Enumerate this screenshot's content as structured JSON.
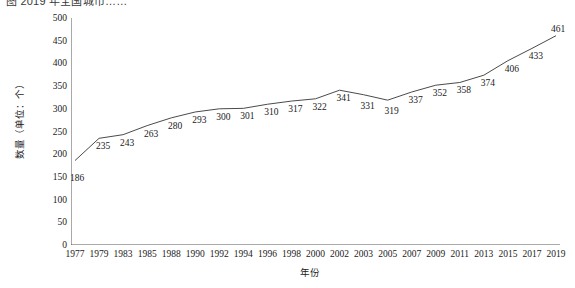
{
  "chart_title": "图 2019 年全国城市……",
  "axis": {
    "y_title": "数量（单位：个）",
    "x_title": "年份",
    "y_ticks": [
      "0",
      "50",
      "100",
      "150",
      "200",
      "250",
      "300",
      "350",
      "400",
      "450",
      "500"
    ],
    "x_ticks": [
      "1977",
      "1979",
      "1983",
      "1985",
      "1988",
      "1990",
      "1992",
      "1994",
      "1996",
      "1998",
      "2000",
      "2002",
      "2003",
      "2005",
      "2007",
      "2009",
      "2011",
      "2013",
      "2015",
      "2017",
      "2019"
    ]
  },
  "style": {
    "line_color": "#4a4a4a",
    "axis_color": "#555555",
    "text_color": "#1a1a1a",
    "background": "#ffffff"
  },
  "chart_data": {
    "type": "line",
    "title": "图 2019 年全国城市……",
    "xlabel": "年份",
    "ylabel": "数量（单位：个）",
    "ylim": [
      0,
      500
    ],
    "ytick_step": 50,
    "grid": false,
    "legend": false,
    "markers": false,
    "data_labels": true,
    "categories": [
      "1977",
      "1979",
      "1983",
      "1985",
      "1988",
      "1990",
      "1992",
      "1994",
      "1996",
      "1998",
      "2000",
      "2002",
      "2003",
      "2005",
      "2007",
      "2009",
      "2011",
      "2013",
      "2015",
      "2017",
      "2019"
    ],
    "values": [
      186,
      235,
      243,
      263,
      280,
      293,
      300,
      301,
      310,
      317,
      322,
      341,
      331,
      319,
      337,
      352,
      358,
      374,
      406,
      433,
      461
    ]
  }
}
